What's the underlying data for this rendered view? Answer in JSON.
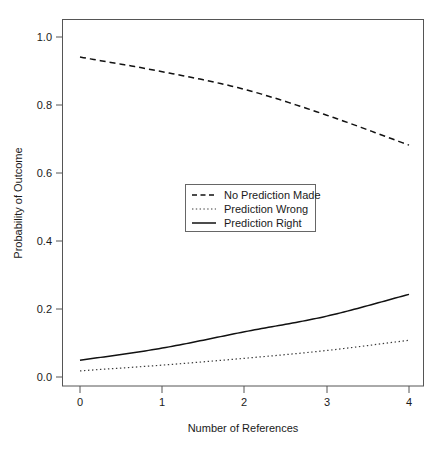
{
  "chart_data": {
    "type": "line",
    "title": "",
    "subtitle": "",
    "xlabel": "Number of References",
    "ylabel": "Probability of Outcome",
    "x": [
      0,
      1,
      2,
      3,
      4
    ],
    "xlim": [
      0,
      4
    ],
    "ylim": [
      0.0,
      1.04
    ],
    "xticks": [
      "0",
      "1",
      "2",
      "3",
      "4"
    ],
    "yticks": [
      "0.0",
      "0.2",
      "0.4",
      "0.6",
      "0.8",
      "1.0"
    ],
    "xtick_values": [
      0,
      1,
      2,
      3,
      4
    ],
    "ytick_values": [
      0.0,
      0.2,
      0.4,
      0.6,
      0.8,
      1.0
    ],
    "grid": false,
    "legend_position": "center",
    "series": [
      {
        "name": "No Prediction Made",
        "style": "dashed",
        "color": "#111111",
        "values": [
          0.941,
          0.898,
          0.846,
          0.77,
          0.682
        ]
      },
      {
        "name": "Prediction Wrong",
        "style": "dotted",
        "color": "#3a3a3a",
        "values": [
          0.018,
          0.035,
          0.055,
          0.078,
          0.108
        ]
      },
      {
        "name": "Prediction Right",
        "style": "solid",
        "color": "#111111",
        "values": [
          0.049,
          0.085,
          0.133,
          0.179,
          0.243
        ]
      }
    ]
  },
  "legend": {
    "entries": [
      {
        "label": "No Prediction Made",
        "style": "dashed"
      },
      {
        "label": "Prediction Wrong",
        "style": "dotted"
      },
      {
        "label": "Prediction Right",
        "style": "solid"
      }
    ]
  },
  "axes": {
    "x_title": "Number of References",
    "y_title": "Probability of Outcome",
    "x_tick_labels": [
      "0",
      "1",
      "2",
      "3",
      "4"
    ],
    "y_tick_labels": [
      "0.0",
      "0.2",
      "0.4",
      "0.6",
      "0.8",
      "1.0"
    ]
  },
  "colors": {
    "background": "#ffffff",
    "frame": "#555555",
    "text": "#1a1a1a",
    "line_primary": "#111111",
    "line_secondary": "#3a3a3a"
  }
}
